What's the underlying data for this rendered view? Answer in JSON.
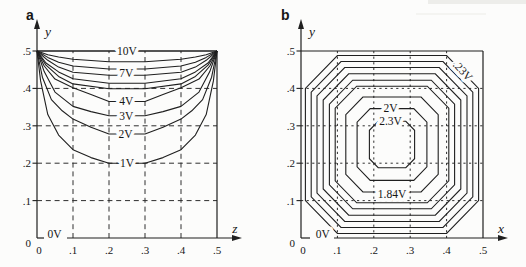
{
  "page": {
    "colors": {
      "ink": "#1f1f1f",
      "grid_ink": "#2e2e2e",
      "background": "#fcfcfb",
      "scan_strip": "#ededea"
    }
  },
  "chart_data": [
    {
      "type": "contour",
      "panel": "a",
      "description_visible_text_only": "",
      "axis": {
        "x_label": "z",
        "y_label": "y",
        "x_ticks": [
          "0",
          ".1",
          ".2",
          ".3",
          ".4",
          ".5"
        ],
        "y_ticks": [
          "0",
          ".1",
          ".2",
          ".3",
          ".4",
          ".5"
        ],
        "xlim": [
          0,
          0.5
        ],
        "ylim": [
          0,
          0.5
        ],
        "grid": "dashed"
      },
      "contours": [
        {
          "level": "10V",
          "points": [
            [
              0,
              0.5
            ],
            [
              0.5,
              0.5
            ]
          ]
        },
        {
          "level": null,
          "points": [
            [
              0,
              0.5
            ],
            [
              0.03,
              0.49
            ],
            [
              0.06,
              0.484
            ],
            [
              0.1,
              0.478
            ],
            [
              0.2,
              0.471
            ],
            [
              0.3,
              0.471
            ],
            [
              0.4,
              0.478
            ],
            [
              0.44,
              0.484
            ],
            [
              0.47,
              0.49
            ],
            [
              0.5,
              0.5
            ]
          ]
        },
        {
          "level": null,
          "points": [
            [
              0,
              0.5
            ],
            [
              0.03,
              0.483
            ],
            [
              0.06,
              0.47
            ],
            [
              0.1,
              0.46
            ],
            [
              0.2,
              0.452
            ],
            [
              0.3,
              0.452
            ],
            [
              0.4,
              0.46
            ],
            [
              0.44,
              0.47
            ],
            [
              0.47,
              0.483
            ],
            [
              0.5,
              0.5
            ]
          ]
        },
        {
          "level": "7V",
          "points": [
            [
              0,
              0.5
            ],
            [
              0.03,
              0.475
            ],
            [
              0.06,
              0.457
            ],
            [
              0.1,
              0.443
            ],
            [
              0.2,
              0.435
            ],
            [
              0.3,
              0.435
            ],
            [
              0.4,
              0.443
            ],
            [
              0.44,
              0.457
            ],
            [
              0.47,
              0.475
            ],
            [
              0.5,
              0.5
            ]
          ]
        },
        {
          "level": null,
          "points": [
            [
              0,
              0.5
            ],
            [
              0.025,
              0.468
            ],
            [
              0.06,
              0.444
            ],
            [
              0.1,
              0.426
            ],
            [
              0.2,
              0.414
            ],
            [
              0.3,
              0.414
            ],
            [
              0.4,
              0.426
            ],
            [
              0.44,
              0.444
            ],
            [
              0.475,
              0.468
            ],
            [
              0.5,
              0.5
            ]
          ]
        },
        {
          "level": null,
          "points": [
            [
              0,
              0.5
            ],
            [
              0.025,
              0.462
            ],
            [
              0.06,
              0.432
            ],
            [
              0.1,
              0.412
            ],
            [
              0.2,
              0.399
            ],
            [
              0.3,
              0.399
            ],
            [
              0.4,
              0.412
            ],
            [
              0.44,
              0.432
            ],
            [
              0.475,
              0.462
            ],
            [
              0.5,
              0.5
            ]
          ]
        },
        {
          "level": "4V",
          "points": [
            [
              0,
              0.5
            ],
            [
              0.02,
              0.46
            ],
            [
              0.05,
              0.425
            ],
            [
              0.1,
              0.402
            ],
            [
              0.15,
              0.384
            ],
            [
              0.2,
              0.365
            ],
            [
              0.3,
              0.365
            ],
            [
              0.35,
              0.384
            ],
            [
              0.4,
              0.402
            ],
            [
              0.45,
              0.425
            ],
            [
              0.48,
              0.46
            ],
            [
              0.5,
              0.5
            ]
          ]
        },
        {
          "level": "3V",
          "points": [
            [
              0,
              0.5
            ],
            [
              0.02,
              0.445
            ],
            [
              0.05,
              0.39
            ],
            [
              0.1,
              0.352
            ],
            [
              0.15,
              0.338
            ],
            [
              0.2,
              0.327
            ],
            [
              0.3,
              0.327
            ],
            [
              0.35,
              0.338
            ],
            [
              0.4,
              0.352
            ],
            [
              0.45,
              0.39
            ],
            [
              0.48,
              0.445
            ],
            [
              0.5,
              0.5
            ]
          ]
        },
        {
          "level": "2V",
          "points": [
            [
              0,
              0.5
            ],
            [
              0.015,
              0.43
            ],
            [
              0.04,
              0.37
            ],
            [
              0.07,
              0.34
            ],
            [
              0.1,
              0.318
            ],
            [
              0.15,
              0.296
            ],
            [
              0.2,
              0.278
            ],
            [
              0.3,
              0.278
            ],
            [
              0.35,
              0.296
            ],
            [
              0.4,
              0.318
            ],
            [
              0.43,
              0.34
            ],
            [
              0.46,
              0.37
            ],
            [
              0.485,
              0.43
            ],
            [
              0.5,
              0.5
            ]
          ]
        },
        {
          "level": "1V",
          "points": [
            [
              0,
              0.5
            ],
            [
              0.01,
              0.42
            ],
            [
              0.03,
              0.33
            ],
            [
              0.06,
              0.275
            ],
            [
              0.1,
              0.236
            ],
            [
              0.15,
              0.215
            ],
            [
              0.2,
              0.2
            ],
            [
              0.3,
              0.2
            ],
            [
              0.35,
              0.215
            ],
            [
              0.4,
              0.236
            ],
            [
              0.44,
              0.275
            ],
            [
              0.47,
              0.33
            ],
            [
              0.49,
              0.42
            ],
            [
              0.5,
              0.5
            ]
          ]
        }
      ],
      "labels": [
        {
          "text": "10V",
          "x": 0.25,
          "y": 0.5,
          "rotate": 0
        },
        {
          "text": "7V",
          "x": 0.248,
          "y": 0.441,
          "rotate": 0
        },
        {
          "text": "4V",
          "x": 0.248,
          "y": 0.366,
          "rotate": 0
        },
        {
          "text": "3V",
          "x": 0.248,
          "y": 0.327,
          "rotate": 0
        },
        {
          "text": "2V",
          "x": 0.246,
          "y": 0.278,
          "rotate": 0
        },
        {
          "text": "1V",
          "x": 0.25,
          "y": 0.201,
          "rotate": 0
        },
        {
          "text": "0V",
          "x": 0.049,
          "y": 0.012,
          "rotate": 0
        }
      ]
    },
    {
      "type": "contour",
      "panel": "b",
      "axis": {
        "x_label": "x",
        "y_label": "y",
        "x_ticks": [
          "0",
          ".1",
          ".2",
          ".3",
          ".4",
          ".5"
        ],
        "y_ticks": [
          "0",
          ".1",
          ".2",
          ".3",
          ".4",
          ".5"
        ],
        "xlim": [
          0,
          0.5
        ],
        "ylim": [
          0,
          0.5
        ],
        "grid": "dotted"
      },
      "center": [
        0.25,
        0.25
      ],
      "rings": [
        {
          "level": ".23V",
          "w": 0.238,
          "s": 0.15
        },
        {
          "level": null,
          "w": 0.222,
          "s": 0.14
        },
        {
          "level": null,
          "w": 0.206,
          "s": 0.13
        },
        {
          "level": null,
          "w": 0.189,
          "s": 0.119
        },
        {
          "level": null,
          "w": 0.172,
          "s": 0.108
        },
        {
          "level": null,
          "w": 0.156,
          "s": 0.097
        },
        {
          "level": "1.84V",
          "w": 0.127,
          "s": 0.08
        },
        {
          "level": "2V",
          "w": 0.096,
          "s": 0.06
        },
        {
          "level": "2.3V",
          "w": 0.062,
          "s": 0.038
        }
      ],
      "labels": [
        {
          "text": ".23V",
          "x": 0.445,
          "y": 0.447,
          "rotate": 47
        },
        {
          "text": "2V",
          "x": 0.246,
          "y": 0.348,
          "rotate": 0
        },
        {
          "text": "2.3V",
          "x": 0.246,
          "y": 0.314,
          "rotate": 0
        },
        {
          "text": "1.84V",
          "x": 0.25,
          "y": 0.118,
          "rotate": 0
        },
        {
          "text": "0V",
          "x": 0.06,
          "y": 0.012,
          "rotate": 0
        }
      ]
    }
  ]
}
